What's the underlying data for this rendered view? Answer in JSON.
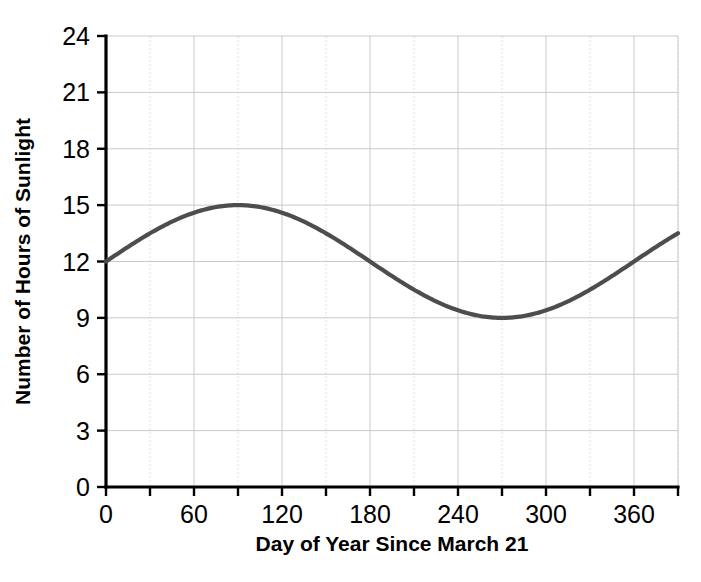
{
  "chart_data": {
    "type": "line",
    "title": "",
    "xlabel": "Day of Year Since March 21",
    "ylabel": "Number of Hours of Sunlight",
    "xlim": [
      0,
      390
    ],
    "ylim": [
      0,
      24
    ],
    "x_ticks_labeled": [
      0,
      60,
      120,
      180,
      240,
      300,
      360
    ],
    "x_ticks_all": [
      0,
      30,
      60,
      90,
      120,
      150,
      180,
      210,
      240,
      270,
      300,
      330,
      360,
      390
    ],
    "y_ticks": [
      0,
      3,
      6,
      9,
      12,
      15,
      18,
      21,
      24
    ],
    "x_tick_labels": [
      "0",
      "60",
      "120",
      "180",
      "240",
      "300",
      "360"
    ],
    "y_tick_labels": [
      "0",
      "3",
      "6",
      "9",
      "12",
      "15",
      "18",
      "21",
      "24"
    ],
    "grid": true,
    "legend": null,
    "series": [
      {
        "name": "Hours of Sunlight",
        "color": "#4d4d4d",
        "function": "12 + 3*sin(2*pi*x/360)",
        "x": [
          0,
          15,
          30,
          45,
          60,
          75,
          90,
          105,
          120,
          135,
          150,
          165,
          180,
          195,
          210,
          225,
          240,
          255,
          270,
          285,
          300,
          315,
          330,
          345,
          360,
          375,
          390
        ],
        "values": [
          12.0,
          12.77,
          13.5,
          14.12,
          14.6,
          14.9,
          15.0,
          14.9,
          14.6,
          14.12,
          13.5,
          12.77,
          12.0,
          11.23,
          10.5,
          9.88,
          9.4,
          9.1,
          9.0,
          9.1,
          9.4,
          9.88,
          10.5,
          11.23,
          12.0,
          12.77,
          13.5
        ]
      }
    ],
    "annotations": {
      "start_value": 12,
      "max_value": 15,
      "max_at_day": 90,
      "min_value": 9,
      "min_at_day": 270,
      "period_days": 360,
      "amplitude": 3,
      "midline": 12
    }
  },
  "axis": {
    "y_title": "Number of Hours of Sunlight",
    "x_title": "Day of Year Since March 21"
  },
  "colors": {
    "curve": "#4d4d4d",
    "axis": "#000000",
    "grid_major": "#c9c9c9",
    "grid_minor": "#e0e0e0",
    "background": "#ffffff"
  }
}
